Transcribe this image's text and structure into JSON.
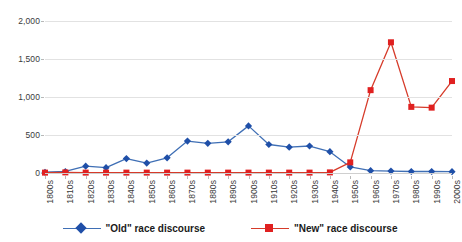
{
  "chart_data": {
    "type": "line",
    "title": "",
    "subtitle": "",
    "xlabel": "",
    "ylabel": "",
    "ylim": [
      0,
      2000
    ],
    "yticks": [
      0,
      500,
      1000,
      1500,
      2000
    ],
    "ytick_labels": [
      "0",
      "500",
      "1,000",
      "1,500",
      "2,000"
    ],
    "grid": true,
    "legend_position": "bottom",
    "categories": [
      "1800s",
      "1810s",
      "1820s",
      "1830s",
      "1840s",
      "1850s",
      "1860s",
      "1870s",
      "1880s",
      "1890s",
      "1900s",
      "1910s",
      "1920s",
      "1930s",
      "1940s",
      "1950s",
      "1960s",
      "1970s",
      "1980s",
      "1990s",
      "2000s"
    ],
    "series": [
      {
        "name": "\"Old\" race discourse",
        "color": "#1f4fa8",
        "line_color": "#3f6fb5",
        "marker": "diamond",
        "values": [
          10,
          20,
          90,
          70,
          190,
          130,
          200,
          420,
          390,
          410,
          620,
          375,
          340,
          355,
          280,
          80,
          30,
          25,
          20,
          20,
          18
        ]
      },
      {
        "name": "\"New\" race discourse",
        "color": "#e02020",
        "line_color": "#d63b2a",
        "marker": "square",
        "values": [
          5,
          8,
          5,
          5,
          5,
          5,
          5,
          5,
          5,
          5,
          5,
          5,
          5,
          5,
          8,
          140,
          1090,
          1720,
          870,
          860,
          1210
        ]
      }
    ]
  },
  "legend": {
    "entries": [
      {
        "label": "\"Old\" race discourse"
      },
      {
        "label": "\"New\" race discourse"
      }
    ]
  }
}
